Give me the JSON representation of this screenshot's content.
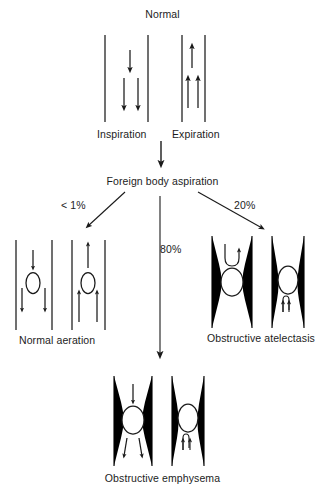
{
  "diagram": {
    "title": "Normal",
    "nodes": {
      "normal": "Normal",
      "inspiration": "Inspiration",
      "expiration": "Expiration",
      "foreign_body": "Foreign body aspiration",
      "normal_aeration": "Normal aeration",
      "obstructive_atelectasis": "Obstructive atelectasis",
      "obstructive_emphysema": "Obstructive emphysema"
    },
    "branches": [
      {
        "label": "< 1%",
        "outcome": "Normal aeration",
        "direction": "left"
      },
      {
        "label": "80%",
        "outcome": "Obstructive emphysema",
        "direction": "down"
      },
      {
        "label": "20%",
        "outcome": "Obstructive atelectasis",
        "direction": "right"
      }
    ],
    "colors": {
      "stroke": "#1a1a1a",
      "fill": "#000000",
      "background": "#ffffff",
      "text": "#1c1c1c"
    },
    "figures": [
      {
        "group": "normal",
        "name": "inspiration-airway",
        "wall": "straight",
        "body": "none",
        "flow": "downward"
      },
      {
        "group": "normal",
        "name": "expiration-airway",
        "wall": "straight",
        "body": "none",
        "flow": "upward"
      },
      {
        "group": "normal-aeration",
        "name": "normal-aeration-inspiration",
        "wall": "straight",
        "body": "ellipse",
        "flow": "downward"
      },
      {
        "group": "normal-aeration",
        "name": "normal-aeration-expiration",
        "wall": "straight",
        "body": "ellipse",
        "flow": "upward"
      },
      {
        "group": "obstructive-atelectasis",
        "name": "atelectasis-inspiration",
        "wall": "collapsed",
        "body": "ellipse",
        "flow": "blocked-downward"
      },
      {
        "group": "obstructive-atelectasis",
        "name": "atelectasis-expiration",
        "wall": "narrowed",
        "body": "ellipse",
        "flow": "upward-small"
      },
      {
        "group": "obstructive-emphysema",
        "name": "emphysema-inspiration",
        "wall": "collapsed",
        "body": "ellipse",
        "flow": "downward-past"
      },
      {
        "group": "obstructive-emphysema",
        "name": "emphysema-expiration",
        "wall": "narrowed",
        "body": "ellipse",
        "flow": "blocked-upward"
      }
    ]
  }
}
